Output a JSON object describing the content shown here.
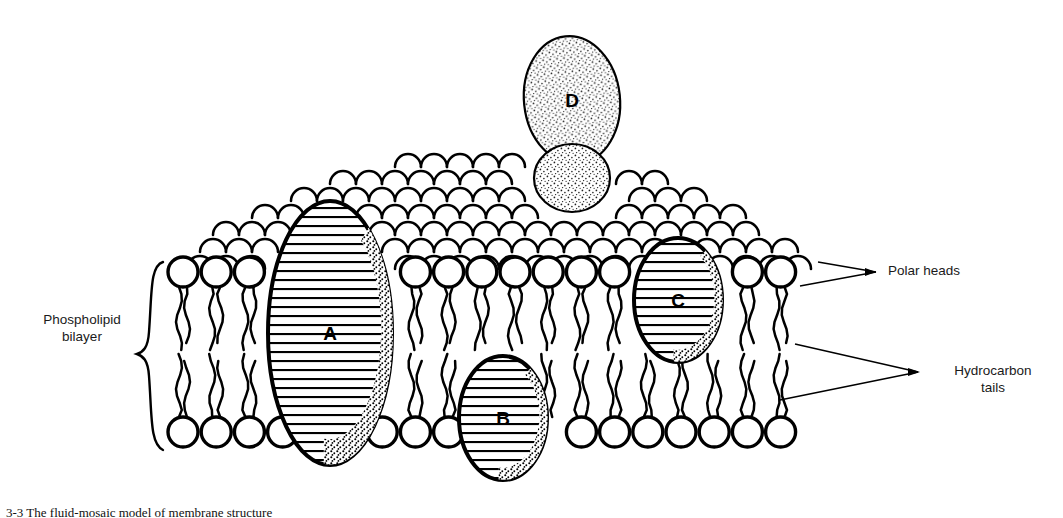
{
  "figure": {
    "caption_fragment": "3-3 The fluid-mosaic model of membrane structure"
  },
  "labels": {
    "bilayer": "Phospholipid\nbilayer",
    "polar_heads": "Polar heads",
    "hydrocarbon_tails": "Hydrocarbon\ntails"
  },
  "proteins": [
    {
      "id": "A",
      "label": "A",
      "kind": "integral-transmembrane",
      "cx": 330,
      "cy": 333,
      "rx": 62,
      "ry": 132,
      "fill": "striped"
    },
    {
      "id": "B",
      "label": "B",
      "kind": "integral-inner-leaflet",
      "cx": 503,
      "cy": 418,
      "rx": 44,
      "ry": 62,
      "fill": "striped"
    },
    {
      "id": "C",
      "label": "C",
      "kind": "integral-outer-leaflet",
      "cx": 678,
      "cy": 300,
      "rx": 44,
      "ry": 62,
      "fill": "striped"
    },
    {
      "id": "D",
      "label": "D",
      "kind": "peripheral-surface",
      "cx": 572,
      "cy": 100,
      "rx": 48,
      "ry": 64,
      "fill": "stippled"
    }
  ],
  "membrane": {
    "head_count_per_row": 22,
    "head_radius": 15,
    "upper_head_row_y": 272,
    "lower_head_row_y": 432,
    "left_edge": 168,
    "right_edge": 820,
    "tail_style": "wavy-double"
  },
  "colors": {
    "ink": "#000000",
    "background": "#ffffff",
    "stipple": "#2b2b2b",
    "text": "#1a1a1a"
  }
}
